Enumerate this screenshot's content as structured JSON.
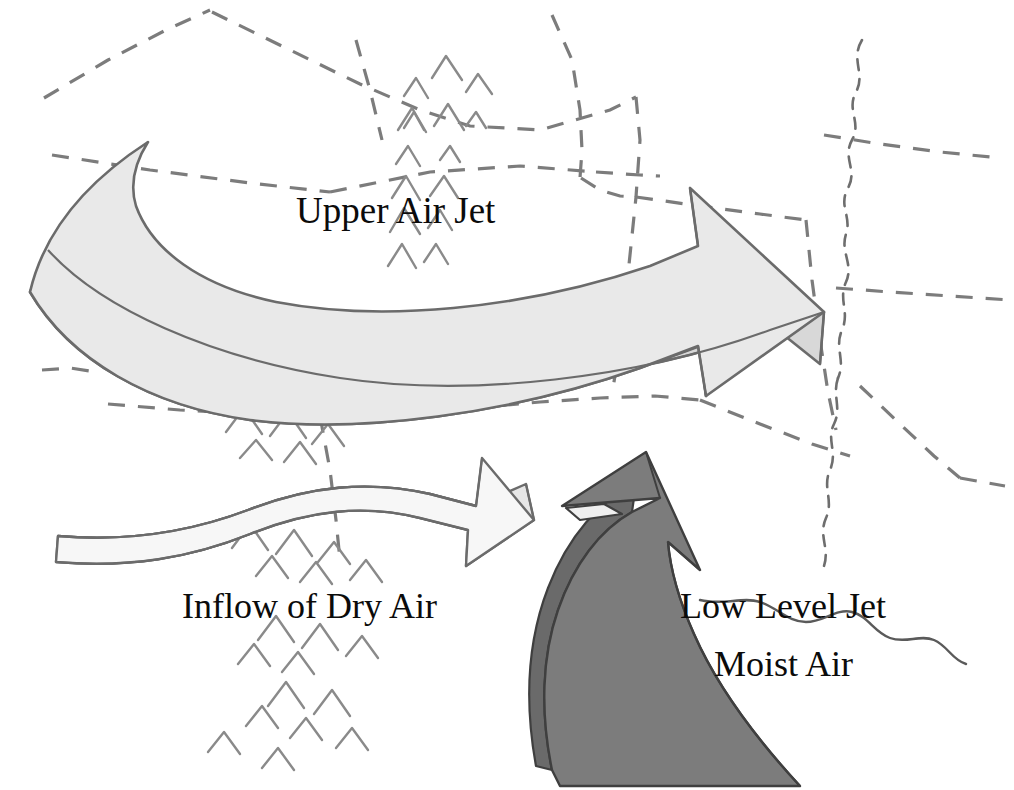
{
  "figure": {
    "kind": "weather-schematic-map",
    "caption_visible": false,
    "background_color": "#ffffff",
    "width": 1014,
    "height": 790
  },
  "labels": {
    "upper_air_jet": "Upper Air Jet",
    "inflow_dry_air": "Inflow of Dry Air",
    "low_level_jet": "Low Level Jet",
    "moist_air": "Moist Air"
  },
  "arrows": [
    {
      "id": "upper-air-jet-arrow",
      "label": "Upper Air Jet",
      "fill": "#e9e9e9",
      "side_fill": "#d2d2d2",
      "stroke": "#6b6b6b",
      "direction": "west-to-east",
      "description": "Broad curved 3D band sweeping from upper-left downward and back up to a large arrowhead at right"
    },
    {
      "id": "inflow-dry-air-arrow",
      "label": "Inflow of Dry Air",
      "fill": "#f6f6f6",
      "side_fill": "#e4e4e4",
      "stroke": "#6b6b6b",
      "direction": "west-to-east",
      "description": "Narrow wavy S-curved 3D band from left edge to an arrowhead near center"
    },
    {
      "id": "low-level-jet-arrow",
      "label": "Low Level Jet Moist Air",
      "fill": "#7c7c7c",
      "side_fill": "#656565",
      "stroke": "#3f3f3f",
      "direction": "south-to-north",
      "description": "Dark gray hook-shaped 3D band rising from the bottom edge, curving left then north to an arrowhead"
    }
  ],
  "map_features": {
    "state_boundaries_style": "dashed",
    "state_boundaries_color": "#7a7a7a",
    "river_style": "wavy-dashed",
    "mountain_symbol": "chevron-ridge-marks",
    "mountain_color": "#8c8c8c"
  },
  "colors": {
    "light_gray_fill": "#e9e9e9",
    "pale_fill": "#f6f6f6",
    "dark_gray_fill": "#7c7c7c",
    "outline": "#6b6b6b",
    "text": "#0b0b0b",
    "background": "#ffffff"
  }
}
